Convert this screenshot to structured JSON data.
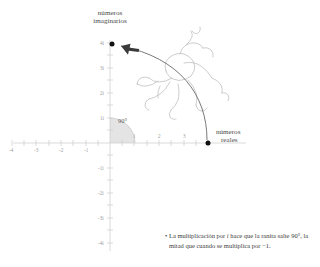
{
  "diagram": {
    "axis_labels": {
      "imaginary": {
        "line1": "números",
        "line2": "imaginarios"
      },
      "real": {
        "line1": "números",
        "line2": "reales"
      }
    },
    "angle_label": "90°",
    "x_ticks": [
      {
        "value": -4,
        "label": "-4"
      },
      {
        "value": -3,
        "label": "-3"
      },
      {
        "value": -2,
        "label": "-2"
      },
      {
        "value": -1,
        "label": "-1"
      },
      {
        "value": 1,
        "label": "1"
      },
      {
        "value": 2,
        "label": "2"
      },
      {
        "value": 3,
        "label": "3"
      }
    ],
    "y_ticks": [
      {
        "value": 4,
        "label": "4i"
      },
      {
        "value": 3,
        "label": "3i"
      },
      {
        "value": 2,
        "label": "2i"
      },
      {
        "value": 1,
        "label": "1i"
      },
      {
        "value": -1,
        "label": "-1i"
      },
      {
        "value": -2,
        "label": "-2i"
      },
      {
        "value": -3,
        "label": "-3i"
      },
      {
        "value": -4,
        "label": "-4i"
      }
    ],
    "points": [
      {
        "name": "start",
        "real": 4,
        "imaginary": 0
      },
      {
        "name": "end",
        "real": 0,
        "imaginary": 4
      }
    ],
    "colors": {
      "axis": "#c9c9c9",
      "curve": "#5a5a5a",
      "point": "#111111",
      "wedge": "#e2e2e2",
      "frog": "#b9b9b9",
      "text": "#3b3b3b",
      "tick_text": "#9b9b9b"
    }
  },
  "caption": {
    "bullet": "•",
    "line1_a": "La multiplicación por ",
    "line1_i": "i",
    "line1_b": " hace que la ranita salte",
    "line2": "90°, la mitad que cuando se multiplica por −1."
  }
}
